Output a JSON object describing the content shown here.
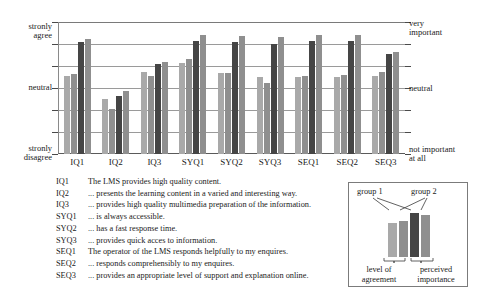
{
  "chart_data": {
    "type": "bar",
    "title": "",
    "xlabel": "",
    "ylabel": "",
    "grid": true,
    "legend_position": "inset-bottom-right",
    "scale_min": 1,
    "scale_max": 7,
    "ylim": [
      1,
      7
    ],
    "left_axis": {
      "top_label_line1": "stronly",
      "top_label_line2": "agree",
      "mid_label": "neutral",
      "bottom_label_line1": "stronly",
      "bottom_label_line2": "disagree"
    },
    "right_axis": {
      "top_label_line1": "very",
      "top_label_line2": "important",
      "mid_label": "neutral",
      "bottom_label_line1": "not important",
      "bottom_label_line2": "at all"
    },
    "categories": [
      "IQ1",
      "IQ2",
      "IQ3",
      "SYQ1",
      "SYQ2",
      "SYQ3",
      "SEQ1",
      "SEQ2",
      "SEQ3"
    ],
    "series": [
      {
        "name": "group 1",
        "measure": "level of agreement",
        "color": "#a9a9a9",
        "values": [
          4.55,
          3.5,
          4.75,
          5.15,
          4.7,
          4.5,
          4.5,
          4.5,
          4.55
        ]
      },
      {
        "name": "group 2",
        "measure": "level of agreement",
        "color": "#8f8f8f",
        "values": [
          4.65,
          3.05,
          4.55,
          5.3,
          4.7,
          4.25,
          4.55,
          4.6,
          4.75
        ]
      },
      {
        "name": "group 1",
        "measure": "perceived importance",
        "color": "#454545",
        "values": [
          6.1,
          3.65,
          5.1,
          6.15,
          6.1,
          6.0,
          6.15,
          6.15,
          5.55
        ]
      },
      {
        "name": "group 2",
        "measure": "perceived importance",
        "color": "#8f8f8f",
        "values": [
          6.25,
          3.85,
          5.2,
          6.4,
          6.35,
          6.3,
          6.4,
          6.4,
          5.65
        ]
      }
    ]
  },
  "key_list": [
    {
      "code": "IQ1",
      "text": "The LMS provides high quality content."
    },
    {
      "code": "IQ2",
      "text": "... presents the learning content in a varied and interesting way."
    },
    {
      "code": "IQ3",
      "text": "... provides high quality multimedia preparation of the information."
    },
    {
      "code": "SYQ1",
      "text": "... is always accessible."
    },
    {
      "code": "SYQ2",
      "text": "... has a fast response time."
    },
    {
      "code": "SYQ3",
      "text": "... provides quick acces to information."
    },
    {
      "code": "SEQ1",
      "text": "The operator of the LMS responds helpfully to my enquires."
    },
    {
      "code": "SEQ2",
      "text": "... responds comprehensibly to my enquires."
    },
    {
      "code": "SEQ3",
      "text": "... provides an appropriate level of support and explanation online."
    }
  ],
  "legend": {
    "group1_label": "group 1",
    "group2_label": "group 2",
    "footer_left_line1": "level of",
    "footer_left_line2": "agreement",
    "footer_right_line1": "perceived",
    "footer_right_line2": "importance",
    "bar_colors": [
      "#a9a9a9",
      "#8f8f8f",
      "#454545",
      "#8f8f8f"
    ],
    "bar_heights": [
      34,
      36,
      44,
      42
    ]
  }
}
